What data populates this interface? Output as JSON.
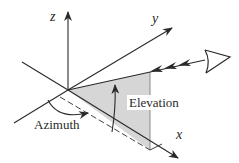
{
  "diagram": {
    "axes": {
      "x": {
        "label": "x"
      },
      "y": {
        "label": "y"
      },
      "z": {
        "label": "z"
      }
    },
    "angles": {
      "azimuth": {
        "label": "Azimuth"
      },
      "elevation": {
        "label": "Elevation"
      }
    },
    "observer": {
      "icon": "eye-icon"
    },
    "colors": {
      "line": "#2a2a2a",
      "shaded_plane": "#d6d6d6",
      "background": "#ffffff"
    }
  }
}
